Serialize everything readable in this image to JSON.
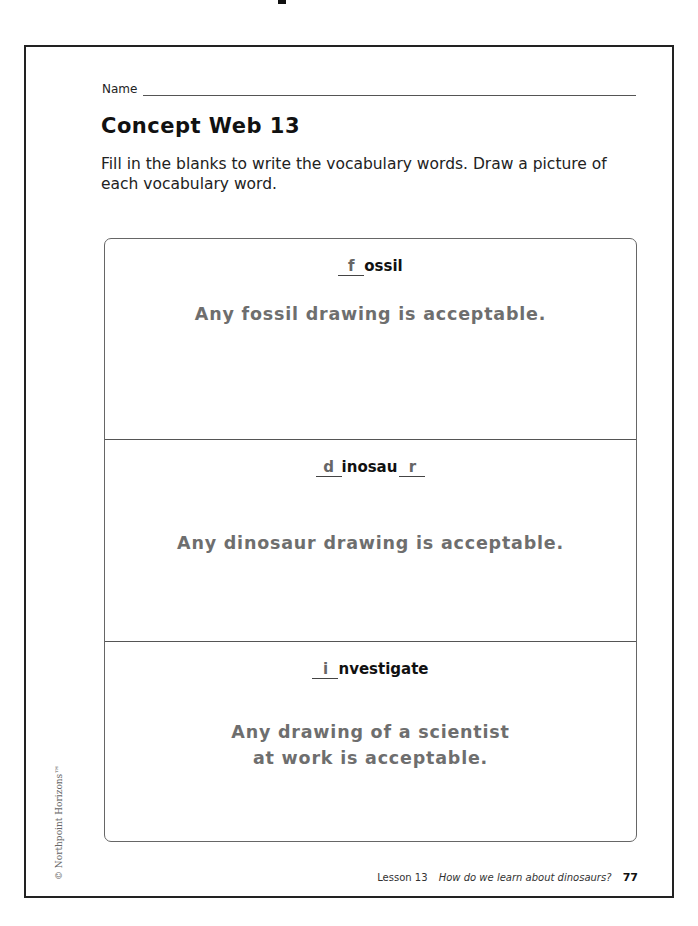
{
  "page": {
    "name_label": "Name",
    "title": "Concept Web 13",
    "instructions": "Fill in the blanks to write the vocabulary words. Draw a picture of each vocabulary word."
  },
  "concept_web": {
    "cells": [
      {
        "word_parts": {
          "blank1": "f",
          "middle": "ossil",
          "blank2": ""
        },
        "full_word": "fossil",
        "answer": "Any fossil drawing is acceptable."
      },
      {
        "word_parts": {
          "blank1": "d",
          "middle": "inosau",
          "blank2": "r"
        },
        "full_word": "dinosaur",
        "answer": "Any dinosaur drawing is acceptable."
      },
      {
        "word_parts": {
          "blank1": "i",
          "middle": "nvestigate",
          "blank2": ""
        },
        "full_word": "investigate",
        "answer_line1": "Any drawing of a scientist",
        "answer_line2": "at work is acceptable."
      }
    ]
  },
  "footer": {
    "copyright": "© Northpoint Horizons™",
    "lesson": "Lesson 13",
    "question": "How do we learn about dinosaurs?",
    "page_number": "77"
  },
  "colors": {
    "text": "#111111",
    "answer_gray": "#6e6e6e",
    "border": "#222222"
  }
}
